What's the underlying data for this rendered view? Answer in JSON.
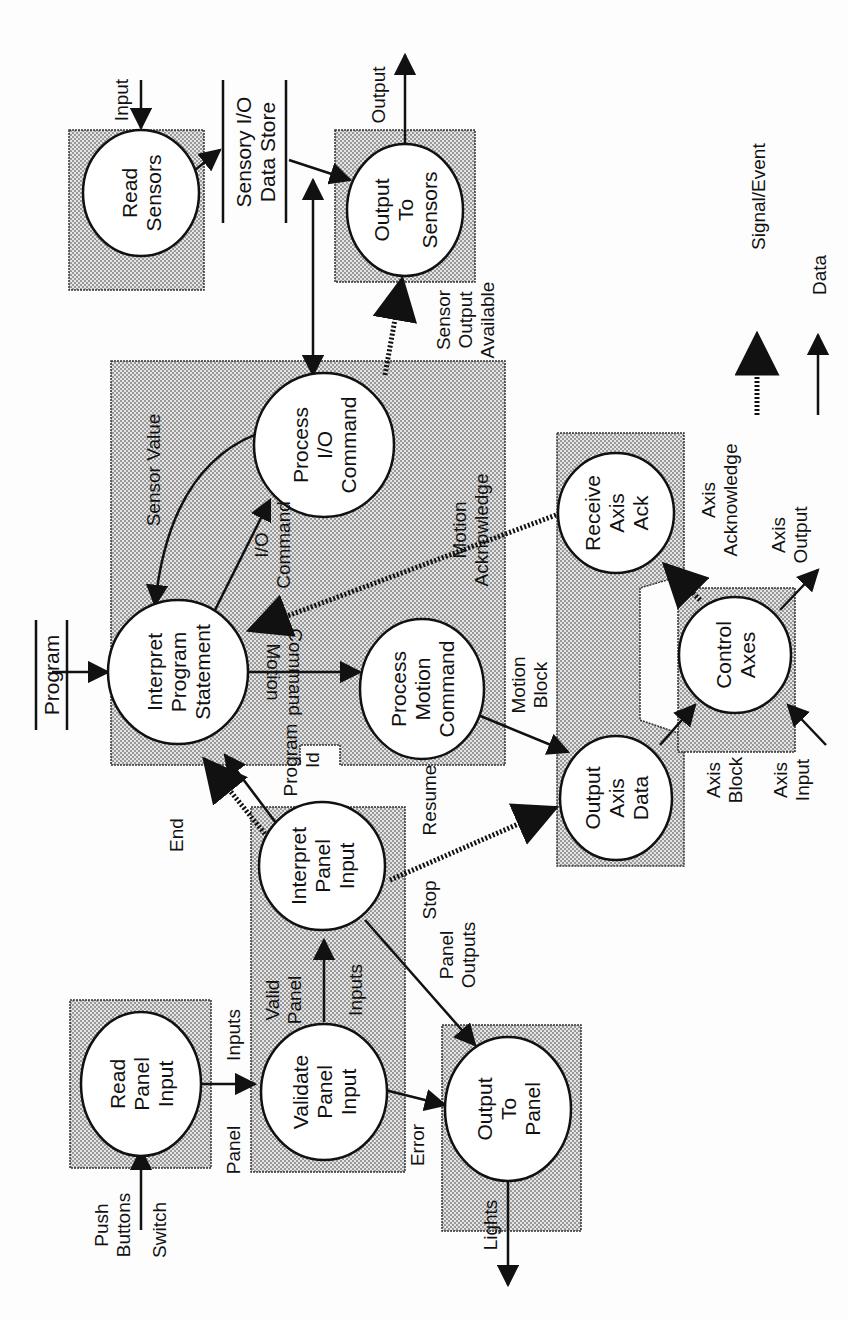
{
  "diagram": {
    "type": "data flow diagram",
    "orientation": "rotated 90deg counter-clockwise",
    "colors": {
      "line": "#111111",
      "shade": "#c8c8c8",
      "paper": "#fdfdfd"
    },
    "processes": [
      {
        "id": "read_sensors",
        "lines": [
          "Read",
          "Sensors"
        ]
      },
      {
        "id": "output_to_sensors",
        "lines": [
          "Output",
          "To",
          "Sensors"
        ]
      },
      {
        "id": "interpret_program_statement",
        "lines": [
          "Interpret",
          "Program",
          "Statement"
        ]
      },
      {
        "id": "process_io_command",
        "lines": [
          "Process",
          "I/O",
          "Command"
        ]
      },
      {
        "id": "process_motion_command",
        "lines": [
          "Process",
          "Motion",
          "Command"
        ]
      },
      {
        "id": "receive_axis_ack",
        "lines": [
          "Receive",
          "Axis",
          "Ack"
        ]
      },
      {
        "id": "output_axis_data",
        "lines": [
          "Output",
          "Axis",
          "Data"
        ]
      },
      {
        "id": "control_axes",
        "lines": [
          "Control",
          "Axes"
        ]
      },
      {
        "id": "interpret_panel_input",
        "lines": [
          "Interpret",
          "Panel",
          "Input"
        ]
      },
      {
        "id": "validate_panel_input",
        "lines": [
          "Validate",
          "Panel",
          "Input"
        ]
      },
      {
        "id": "read_panel_input",
        "lines": [
          "Read",
          "Panel",
          "Input"
        ]
      },
      {
        "id": "output_to_panel",
        "lines": [
          "Output",
          "To",
          "Panel"
        ]
      }
    ],
    "stores": [
      {
        "id": "sensory_io",
        "lines": [
          "Sensory I/O",
          "Data Store"
        ]
      },
      {
        "id": "program",
        "lines": [
          "Program"
        ]
      }
    ],
    "flows": {
      "input": "Input",
      "output": "Output",
      "sensor_output_available": [
        "Sensor",
        "Output",
        "Available"
      ],
      "sensor_value": "Sensor Value",
      "io_command": [
        "I/O",
        "Command"
      ],
      "motion_command": [
        "Motion",
        "Command"
      ],
      "motion_acknowledge": [
        "Motion",
        "Acknowledge"
      ],
      "motion_block": [
        "Motion",
        "Block"
      ],
      "axis_acknowledge": [
        "Axis",
        "Acknowledge"
      ],
      "axis_output": [
        "Axis",
        "Output"
      ],
      "axis_block": [
        "Axis",
        "Block"
      ],
      "axis_input": [
        "Axis",
        "Input"
      ],
      "program_id": [
        "Program",
        "Id"
      ],
      "end": "End",
      "stop": "Stop",
      "resume": "Resume",
      "valid_panel": [
        "Valid",
        "Panel"
      ],
      "inputs": "Inputs",
      "panel_outputs": [
        "Panel",
        "Outputs"
      ],
      "panel_inputs": [
        "Panel",
        "Inputs"
      ],
      "error": "Error",
      "lights": "Lights",
      "push_buttons": [
        "Push",
        "Buttons"
      ],
      "switch": "Switch"
    },
    "legend": [
      {
        "style": "dashed",
        "label": "Signal/Event"
      },
      {
        "style": "solid",
        "label": "Data"
      }
    ]
  }
}
